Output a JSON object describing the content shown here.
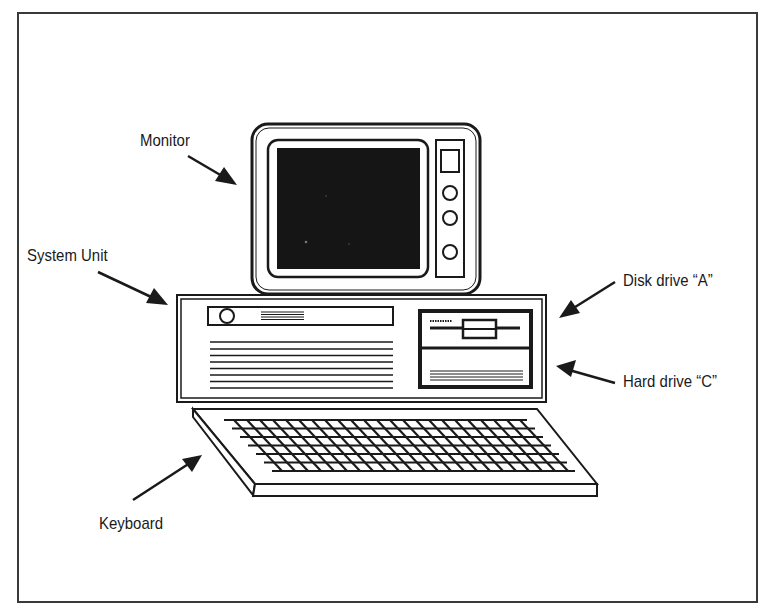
{
  "diagram": {
    "colors": {
      "ink": "#1a1a1a",
      "screen": "#151515",
      "paper": "#ffffff",
      "frame": "#3a3a3a"
    },
    "labels": [
      {
        "id": "monitor",
        "text": "Monitor"
      },
      {
        "id": "system_unit",
        "text": "System Unit"
      },
      {
        "id": "disk_drive_a",
        "text": "Disk drive “A”"
      },
      {
        "id": "hard_drive_c",
        "text": "Hard drive “C”"
      },
      {
        "id": "keyboard",
        "text": "Keyboard"
      }
    ],
    "components": [
      "monitor",
      "system-unit",
      "floppy-disk-drive",
      "hard-drive",
      "keyboard"
    ],
    "monitor_controls": {
      "buttons": 3,
      "display_window": 1
    },
    "keyboard_rows": 7,
    "vent_lines": 8
  }
}
